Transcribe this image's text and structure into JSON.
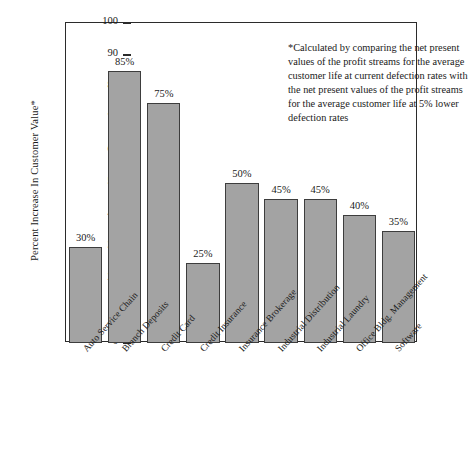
{
  "chart_data": {
    "type": "bar",
    "title": "",
    "subtitle": "",
    "xlabel": "",
    "ylabel": "Percent Increase In Customer Value*",
    "ylim": [
      0,
      100
    ],
    "yticks": [
      0,
      10,
      20,
      30,
      40,
      50,
      60,
      70,
      80,
      90,
      100
    ],
    "ytick_labels": [
      "0",
      "10",
      "20",
      "30",
      "40",
      "50",
      "60",
      "70",
      "80",
      "90",
      "100"
    ],
    "grid": false,
    "legend": "none",
    "bar_color": "#a3a3a3",
    "bar_edge_color": "#3d3d3d",
    "axis_color": "#2b2b2b",
    "categories": [
      "Auto Service Chain",
      "Branch Deposits",
      "Credit Card",
      "Credit Insurance",
      "Insurance Brokerage",
      "Industrial Distribution",
      "Industrial Laundry",
      "Office Bldg. Management",
      "Software"
    ],
    "values": [
      30,
      85,
      75,
      25,
      50,
      45,
      45,
      40,
      35
    ],
    "value_labels": [
      "30%",
      "85%",
      "75%",
      "25%",
      "50%",
      "45%",
      "45%",
      "40%",
      "35%"
    ],
    "annotations": [
      "*Calculated by comparing the net present values of the profit streams for the average customer life at current defection rates with the net present values of the profit streams for the average customer life at 5% lower defection rates"
    ]
  },
  "annotation": {
    "text": "*Calculated by comparing the net present values of the profit streams for the average customer life at current defection rates with the net present values of the profit streams for the average customer life at 5% lower defection rates"
  }
}
